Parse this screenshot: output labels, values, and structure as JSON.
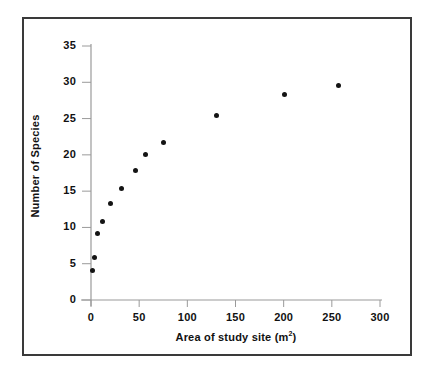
{
  "chart_data": {
    "type": "scatter",
    "title": "",
    "xlabel": "Area of study site (m²)",
    "xlabel_text": "Area of study site (m",
    "xlabel_sup": "2",
    "xlabel_tail": ")",
    "ylabel": "Number of Species",
    "xlim": [
      0,
      300
    ],
    "ylim": [
      0,
      35
    ],
    "xticks": [
      0,
      50,
      100,
      150,
      200,
      250,
      300
    ],
    "xtick_labels": [
      "0",
      "50",
      "100",
      "150",
      "200",
      "250",
      "300"
    ],
    "yticks": [
      0,
      5,
      10,
      15,
      20,
      25,
      30,
      35
    ],
    "ytick_labels": [
      "0",
      "5",
      "10",
      "15",
      "20",
      "25",
      "30",
      "35"
    ],
    "grid": false,
    "legend": "none",
    "marker_color": "#141414",
    "axis_color": "#9a9a9a",
    "frame_color": "#3a3a3a",
    "x": [
      2,
      4,
      7,
      12,
      20,
      32,
      46,
      57,
      75,
      130,
      201,
      257
    ],
    "y": [
      4.1,
      5.8,
      9.2,
      10.8,
      13.3,
      15.4,
      17.9,
      20.0,
      21.7,
      25.4,
      28.3,
      29.6
    ],
    "points": [
      {
        "x": 2,
        "y": 4.1
      },
      {
        "x": 4,
        "y": 5.8
      },
      {
        "x": 7,
        "y": 9.2
      },
      {
        "x": 12,
        "y": 10.8
      },
      {
        "x": 20,
        "y": 13.3
      },
      {
        "x": 32,
        "y": 15.4
      },
      {
        "x": 46,
        "y": 17.9
      },
      {
        "x": 57,
        "y": 20.0
      },
      {
        "x": 75,
        "y": 21.7
      },
      {
        "x": 130,
        "y": 25.4
      },
      {
        "x": 201,
        "y": 28.3
      },
      {
        "x": 257,
        "y": 29.6
      }
    ]
  }
}
